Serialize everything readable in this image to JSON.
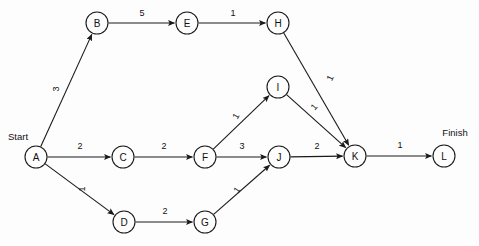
{
  "diagram": {
    "type": "activity-on-node network",
    "start_label": "Start",
    "finish_label": "Finish",
    "colors": {
      "background": "#fdfdfd",
      "stroke": "#1a1a1a",
      "text": "#111111",
      "node_fill": "#fdfdfd"
    },
    "node_radius": 11,
    "nodes": [
      {
        "id": "A",
        "label": "A",
        "x": 36,
        "y": 157
      },
      {
        "id": "B",
        "label": "B",
        "x": 97,
        "y": 23
      },
      {
        "id": "C",
        "label": "C",
        "x": 123,
        "y": 157
      },
      {
        "id": "D",
        "label": "D",
        "x": 124,
        "y": 222
      },
      {
        "id": "E",
        "label": "E",
        "x": 187,
        "y": 23
      },
      {
        "id": "F",
        "label": "F",
        "x": 205,
        "y": 157
      },
      {
        "id": "G",
        "label": "G",
        "x": 205,
        "y": 222
      },
      {
        "id": "H",
        "label": "H",
        "x": 278,
        "y": 23
      },
      {
        "id": "I",
        "label": "I",
        "x": 278,
        "y": 87
      },
      {
        "id": "J",
        "label": "J",
        "x": 279,
        "y": 157
      },
      {
        "id": "K",
        "label": "K",
        "x": 355,
        "y": 156
      },
      {
        "id": "L",
        "label": "L",
        "x": 444,
        "y": 156
      }
    ],
    "edges": [
      {
        "from": "A",
        "to": "B",
        "weight": "3",
        "lx": 56,
        "ly": 89,
        "rot": -90
      },
      {
        "from": "A",
        "to": "C",
        "weight": "2",
        "lx": 80,
        "ly": 146,
        "rot": 0
      },
      {
        "from": "A",
        "to": "D",
        "weight": "1",
        "lx": 82,
        "ly": 189,
        "rot": -90
      },
      {
        "from": "B",
        "to": "E",
        "weight": "5",
        "lx": 142,
        "ly": 13,
        "rot": 0
      },
      {
        "from": "C",
        "to": "F",
        "weight": "2",
        "lx": 164,
        "ly": 146,
        "rot": 0
      },
      {
        "from": "D",
        "to": "G",
        "weight": "2",
        "lx": 165,
        "ly": 211,
        "rot": 0
      },
      {
        "from": "E",
        "to": "H",
        "weight": "1",
        "lx": 233,
        "ly": 13,
        "rot": 0
      },
      {
        "from": "F",
        "to": "I",
        "weight": "1",
        "lx": 236,
        "ly": 116,
        "rot": -60
      },
      {
        "from": "F",
        "to": "J",
        "weight": "3",
        "lx": 242,
        "ly": 146,
        "rot": 0
      },
      {
        "from": "G",
        "to": "J",
        "weight": "1",
        "lx": 237,
        "ly": 190,
        "rot": -55
      },
      {
        "from": "H",
        "to": "K",
        "weight": "1",
        "lx": 330,
        "ly": 78,
        "rot": -65
      },
      {
        "from": "I",
        "to": "K",
        "weight": "1",
        "lx": 314,
        "ly": 107,
        "rot": -50
      },
      {
        "from": "J",
        "to": "K",
        "weight": "2",
        "lx": 317,
        "ly": 146,
        "rot": 0
      },
      {
        "from": "K",
        "to": "L",
        "weight": "1",
        "lx": 400,
        "ly": 145,
        "rot": 0
      }
    ],
    "terminals": [
      {
        "name": "start",
        "label": "Start",
        "x": 8,
        "y": 136,
        "anchor": "start"
      },
      {
        "name": "finish",
        "label": "Finish",
        "x": 455,
        "y": 132,
        "anchor": "middle"
      }
    ]
  }
}
